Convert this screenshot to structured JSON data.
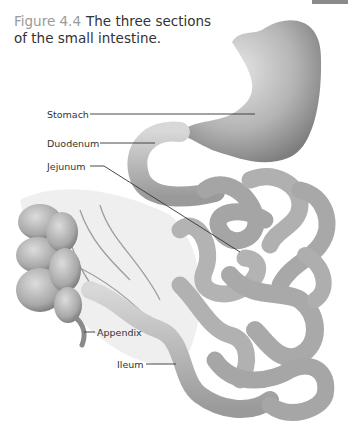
{
  "figure": {
    "number": "Figure 4.4",
    "title": "The three sections of the small intestine."
  },
  "labels": [
    {
      "text": "Stomach",
      "x": 47,
      "y": 109
    },
    {
      "text": "Duodenum",
      "x": 47,
      "y": 138
    },
    {
      "text": "Jejunum",
      "x": 47,
      "y": 161
    },
    {
      "text": "Appendix",
      "x": 97,
      "y": 327
    },
    {
      "text": "Ileum",
      "x": 117,
      "y": 359
    }
  ],
  "colors": {
    "figure_number": "#9a9a9a",
    "caption_text": "#333333",
    "leader_line": "#333333",
    "corner_tab": "#8a8a8a"
  }
}
